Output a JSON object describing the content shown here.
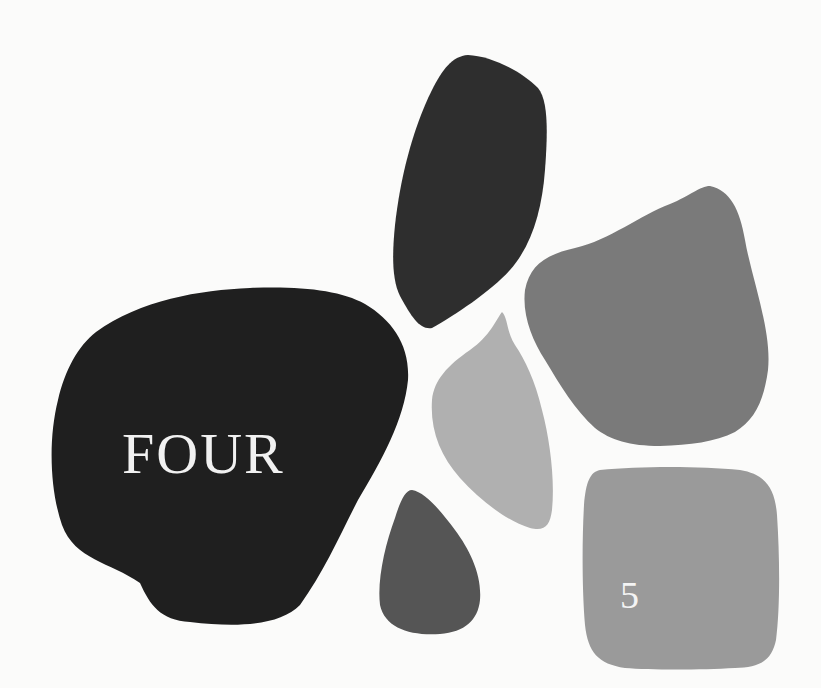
{
  "page": {
    "chapter_word": "FOUR",
    "page_number": "5",
    "background_color": "#fbfbfa"
  },
  "shapes": [
    {
      "name": "large-black-stone",
      "color": "#1f1f1f"
    },
    {
      "name": "tall-dark-stone",
      "color": "#2e2e2e"
    },
    {
      "name": "medium-gray-stone",
      "color": "#7a7a7a"
    },
    {
      "name": "light-gray-leaf-stone",
      "color": "#b0b0b0"
    },
    {
      "name": "small-dark-gray-teardrop",
      "color": "#555555"
    },
    {
      "name": "rounded-square-stone",
      "color": "#9a9a9a"
    }
  ]
}
